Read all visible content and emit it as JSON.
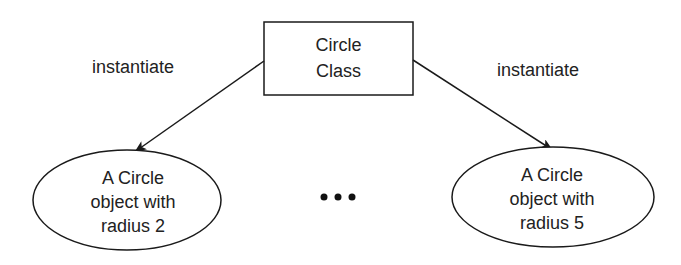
{
  "diagram": {
    "class_box": {
      "lines": [
        "Circle",
        "Class"
      ]
    },
    "edges": [
      {
        "label": "instantiate",
        "direction": "left"
      },
      {
        "label": "instantiate",
        "direction": "right"
      }
    ],
    "objects": [
      {
        "lines": [
          "A Circle",
          "object with",
          "radius 2"
        ]
      },
      {
        "lines": [
          "A Circle",
          "object with",
          "radius 5"
        ]
      }
    ],
    "ellipsis": "•••",
    "colors": {
      "stroke": "#1a1a1a",
      "text": "#222222",
      "background": "#ffffff"
    }
  }
}
